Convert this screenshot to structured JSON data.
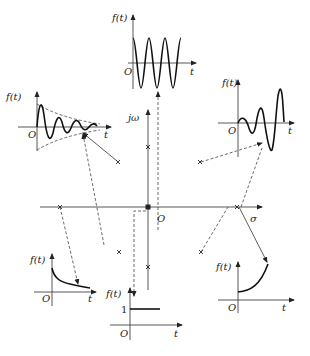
{
  "diagram": {
    "title": "",
    "s_plane": {
      "real_axis_label": "σ",
      "imag_axis_label": "jω",
      "origin_label": "O"
    },
    "plots": {
      "top_center": {
        "ylabel": "f(t)",
        "xlabel": "t",
        "origin": "O",
        "description": "sustained oscillation (poles on jω axis)"
      },
      "upper_left": {
        "ylabel": "f(t)",
        "xlabel": "t",
        "origin": "O",
        "description": "decaying oscillation (poles in left half plane)"
      },
      "upper_right": {
        "ylabel": "f(t)",
        "xlabel": "t",
        "origin": "O",
        "description": "growing oscillation (poles in right half plane)"
      },
      "lower_left": {
        "ylabel": "f(t)",
        "xlabel": "t",
        "origin": "O",
        "description": "decaying exponential (real negative pole)"
      },
      "lower_right": {
        "ylabel": "f(t)",
        "xlabel": "t",
        "origin": "O",
        "description": "growing exponential (real positive pole)"
      },
      "bottom_center": {
        "ylabel": "f(t)",
        "xlabel": "t",
        "origin": "O",
        "step_value": "1",
        "description": "step (pole at origin)"
      }
    },
    "poles": [
      {
        "location": "origin",
        "marker": "×"
      },
      {
        "location": "jω axis upper",
        "marker": "×"
      },
      {
        "location": "jω axis lower",
        "marker": "×"
      },
      {
        "location": "left half plane upper",
        "marker": "×"
      },
      {
        "location": "left half plane lower",
        "marker": "×"
      },
      {
        "location": "right half plane upper",
        "marker": "×"
      },
      {
        "location": "right half plane lower",
        "marker": "×"
      },
      {
        "location": "negative real axis",
        "marker": "×"
      },
      {
        "location": "positive real axis",
        "marker": "×"
      }
    ]
  }
}
